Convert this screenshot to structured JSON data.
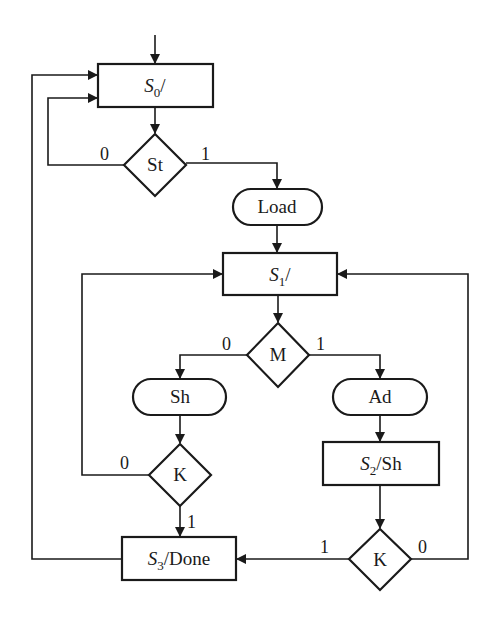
{
  "diagram": {
    "type": "ASM chart",
    "colors": {
      "stroke": "#1a1a1a",
      "background": "#ffffff"
    },
    "states": [
      {
        "id": "S0",
        "name": "S",
        "sub": "0",
        "output": "/"
      },
      {
        "id": "S1",
        "name": "S",
        "sub": "1",
        "output": "/"
      },
      {
        "id": "S2",
        "name": "S",
        "sub": "2",
        "output": "/Sh"
      },
      {
        "id": "S3",
        "name": "S",
        "sub": "3",
        "output": "/Done"
      }
    ],
    "decisions": [
      {
        "id": "St",
        "label": "St",
        "zero": "0",
        "one": "1"
      },
      {
        "id": "M",
        "label": "M",
        "zero": "0",
        "one": "1"
      },
      {
        "id": "K1",
        "label": "K",
        "zero": "0",
        "one": "1"
      },
      {
        "id": "K2",
        "label": "K",
        "zero": "0",
        "one": "1"
      }
    ],
    "conditional_outputs": [
      {
        "id": "Load",
        "label": "Load"
      },
      {
        "id": "Sh",
        "label": "Sh"
      },
      {
        "id": "Ad",
        "label": "Ad"
      }
    ]
  }
}
